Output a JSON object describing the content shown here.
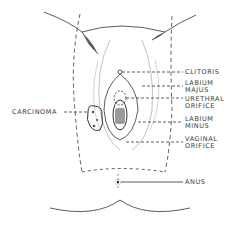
{
  "diagram": {
    "labels": {
      "clitoris": "CLITORIS",
      "labium_majus_1": "LABIUM",
      "labium_majus_2": "MAJUS",
      "urethral_1": "URETHRAL",
      "urethral_2": "ORIFICE",
      "labium_minus_1": "LABIUM",
      "labium_minus_2": "MINUS",
      "vaginal_1": "VAGINAL",
      "vaginal_2": "ORIFICE",
      "anus": "ANUS",
      "carcinoma": "CARCINOMA"
    },
    "colors": {
      "line": "#333333",
      "shade": "#777777",
      "label": "#3a3a3a"
    }
  }
}
